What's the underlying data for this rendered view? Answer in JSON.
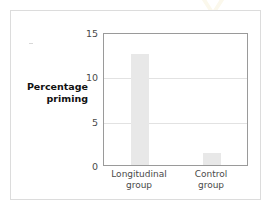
{
  "figure": {
    "watermark_icon": "chevron-down-watermark",
    "border_color": "#dcdcdc",
    "bar_color": "#e8e8e8",
    "axis_color": "#9a9a9a",
    "grid_color": "#e2e2e2"
  },
  "chart_data": {
    "type": "bar",
    "title": "",
    "xlabel": "",
    "ylabel": "Percentage priming",
    "categories": [
      "Longitudinal group",
      "Control group"
    ],
    "category_lines": [
      [
        "Longitudinal",
        "group"
      ],
      [
        "Control",
        "group"
      ]
    ],
    "values": [
      12.5,
      1.4
    ],
    "ylim": [
      0,
      15
    ],
    "yticks": [
      0,
      5,
      10,
      15
    ],
    "ytick_labels": [
      "0",
      "5",
      "10",
      "15"
    ],
    "gridlines": [
      5,
      10
    ],
    "grid": true,
    "legend": "none"
  }
}
